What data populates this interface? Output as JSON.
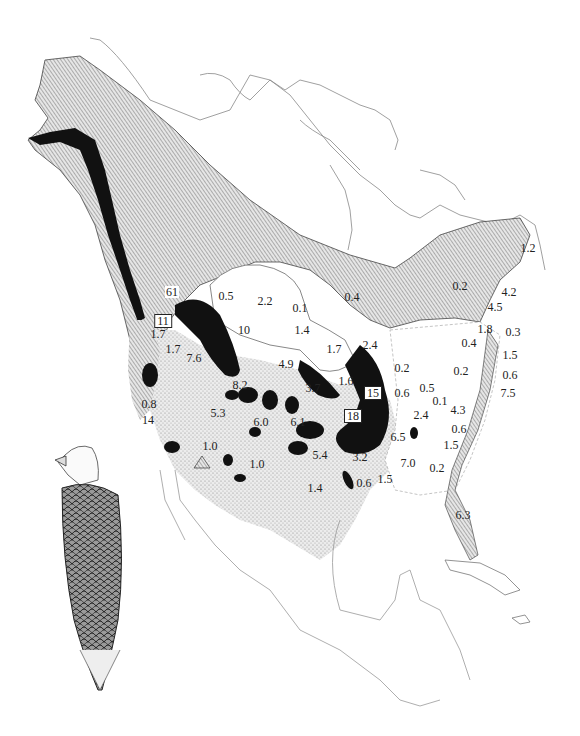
{
  "map": {
    "subject": "Bald eagle winter distribution, North America",
    "legend_shading": {
      "summer_range": "diagonal hatch",
      "winter_range": "stipple",
      "concentration": "solid black"
    },
    "colors": {
      "ink": "#111111",
      "hatch": "#8a8a8a",
      "stipple": "#c9c9c9",
      "paper": "#ffffff"
    },
    "labels": [
      {
        "id": "l61",
        "text": "61",
        "x": 172,
        "y": 292,
        "style": "inv"
      },
      {
        "id": "l11",
        "text": "11",
        "x": 163,
        "y": 321,
        "style": "boxed"
      },
      {
        "id": "l0_5a",
        "text": "0.5",
        "x": 226,
        "y": 296
      },
      {
        "id": "l2_2",
        "text": "2.2",
        "x": 265,
        "y": 301
      },
      {
        "id": "l0_1a",
        "text": "0.1",
        "x": 300,
        "y": 308
      },
      {
        "id": "l0_4a",
        "text": "0.4",
        "x": 352,
        "y": 297
      },
      {
        "id": "l0_2a",
        "text": "0.2",
        "x": 460,
        "y": 286
      },
      {
        "id": "l1_2",
        "text": "1.2",
        "x": 528,
        "y": 248
      },
      {
        "id": "l4_2",
        "text": "4.2",
        "x": 509,
        "y": 292
      },
      {
        "id": "l4_5",
        "text": "4.5",
        "x": 495,
        "y": 307
      },
      {
        "id": "l1_7a",
        "text": "1.7",
        "x": 173,
        "y": 349
      },
      {
        "id": "l7_6",
        "text": "7.6",
        "x": 194,
        "y": 358
      },
      {
        "id": "l10",
        "text": "10",
        "x": 244,
        "y": 330
      },
      {
        "id": "l1_4a",
        "text": "1.4",
        "x": 302,
        "y": 330
      },
      {
        "id": "l1_7b",
        "text": "1.7",
        "x": 334,
        "y": 349
      },
      {
        "id": "l2_4a",
        "text": "2.4",
        "x": 370,
        "y": 345
      },
      {
        "id": "l4_9",
        "text": "4.9",
        "x": 286,
        "y": 364
      },
      {
        "id": "l1_8",
        "text": "1.8",
        "x": 485,
        "y": 329
      },
      {
        "id": "l0_3",
        "text": "0.3",
        "x": 513,
        "y": 332
      },
      {
        "id": "l0_4b",
        "text": "0.4",
        "x": 469,
        "y": 343
      },
      {
        "id": "l1_5a",
        "text": "1.5",
        "x": 510,
        "y": 355
      },
      {
        "id": "l0_2b",
        "text": "0.2",
        "x": 402,
        "y": 368
      },
      {
        "id": "l0_2c",
        "text": "0.2",
        "x": 461,
        "y": 371
      },
      {
        "id": "l0_6a",
        "text": "0.6",
        "x": 510,
        "y": 375
      },
      {
        "id": "l7_5",
        "text": "7.5",
        "x": 508,
        "y": 393
      },
      {
        "id": "l8_2",
        "text": "8.2",
        "x": 240,
        "y": 385
      },
      {
        "id": "l3_7",
        "text": "3.7",
        "x": 313,
        "y": 388
      },
      {
        "id": "l1_6",
        "text": "1.6",
        "x": 346,
        "y": 381
      },
      {
        "id": "l15",
        "text": "15",
        "x": 373,
        "y": 393,
        "style": "boxed"
      },
      {
        "id": "l0_6b",
        "text": "0.6",
        "x": 402,
        "y": 393
      },
      {
        "id": "l0_5b",
        "text": "0.5",
        "x": 427,
        "y": 388
      },
      {
        "id": "l0_1b",
        "text": "0.1",
        "x": 440,
        "y": 401
      },
      {
        "id": "l4_3",
        "text": "4.3",
        "x": 458,
        "y": 410
      },
      {
        "id": "l1_7c",
        "text": "1.7",
        "x": 158,
        "y": 334
      },
      {
        "id": "l0_8",
        "text": "0.8",
        "x": 149,
        "y": 404
      },
      {
        "id": "l5_3",
        "text": "5.3",
        "x": 218,
        "y": 413
      },
      {
        "id": "l6_0",
        "text": "6.0",
        "x": 261,
        "y": 422
      },
      {
        "id": "l6_1",
        "text": "6.1",
        "x": 298,
        "y": 422
      },
      {
        "id": "l18",
        "text": "18",
        "x": 353,
        "y": 416,
        "style": "boxed"
      },
      {
        "id": "l2_4b",
        "text": "2.4",
        "x": 421,
        "y": 415
      },
      {
        "id": "l0_6c",
        "text": "0.6",
        "x": 459,
        "y": 429
      },
      {
        "id": "l14",
        "text": "14",
        "x": 148,
        "y": 420
      },
      {
        "id": "l6_5",
        "text": "6.5",
        "x": 398,
        "y": 437
      },
      {
        "id": "l1_0a",
        "text": "1.0",
        "x": 210,
        "y": 446
      },
      {
        "id": "l5_4",
        "text": "5.4",
        "x": 320,
        "y": 455
      },
      {
        "id": "l3_2",
        "text": "3.2",
        "x": 360,
        "y": 457
      },
      {
        "id": "l7_0",
        "text": "7.0",
        "x": 408,
        "y": 463
      },
      {
        "id": "l1_5b",
        "text": "1.5",
        "x": 451,
        "y": 445
      },
      {
        "id": "l0_2d",
        "text": "0.2",
        "x": 437,
        "y": 468
      },
      {
        "id": "l1_0b",
        "text": "1.0",
        "x": 257,
        "y": 464
      },
      {
        "id": "l1_4b",
        "text": "1.4",
        "x": 315,
        "y": 488
      },
      {
        "id": "l0_6d",
        "text": "0.6",
        "x": 364,
        "y": 483
      },
      {
        "id": "l1_5c",
        "text": "1.5",
        "x": 385,
        "y": 479
      },
      {
        "id": "l6_3",
        "text": "6.3",
        "x": 463,
        "y": 515
      }
    ]
  },
  "illustration": {
    "subject": "bald eagle perched, rear three-quarter view"
  }
}
